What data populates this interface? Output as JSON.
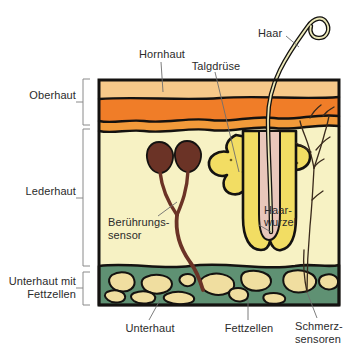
{
  "figure": {
    "language": "de"
  },
  "layer_labels": {
    "epidermis": "Oberhaut",
    "dermis": "Lederhaut",
    "hypodermis_line1": "Unterhaut mit",
    "hypodermis_line2": "Fettzellen"
  },
  "callouts": {
    "hornhaut": "Hornhaut",
    "talgdruese": "Talgdrüse",
    "haar": "Haar",
    "haarwurzel_line1": "Haar-",
    "haarwurzel_line2": "wurzel",
    "beruehrungssensor_line1": "Berührungs-",
    "beruehrungssensor_line2": "sensor",
    "unterhaut": "Unterhaut",
    "fettzellen": "Fettzellen",
    "schmerzsensoren_line1": "Schmerz-",
    "schmerzsensoren_line2": "sensoren"
  },
  "colors": {
    "outline": "#141210",
    "epidermis_top": "#f7c98a",
    "epidermis_band": "#f07d28",
    "epidermis_lower": "#f29a3a",
    "dermis": "#f7f2c4",
    "hypodermis": "#5f9173",
    "fat_cell": "#f0deA0",
    "sebaceous_gland": "#f2dd63",
    "hair_shaft": "#ebe8b8",
    "hair_root": "#e9c7bb",
    "touch_sensor": "#6b3326",
    "pain_nerve": "#3a2a1c",
    "text": "#2b2b2b",
    "bracket": "#8a8a8a",
    "leader": "#6e6e6e",
    "background": "#ffffff"
  },
  "geometry": {
    "box_left": 98,
    "box_right": 340,
    "box_top": 78,
    "box_bottom": 306,
    "epidermis_bottom": 126,
    "dermis_bottom": 268
  }
}
